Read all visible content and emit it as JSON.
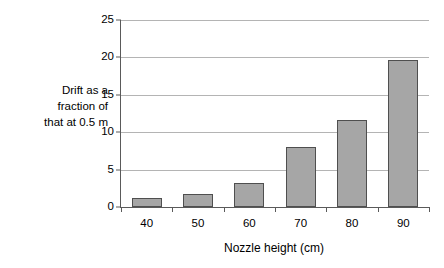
{
  "chart_data": {
    "type": "bar",
    "title": "",
    "subtitle": "",
    "xlabel": "Nozzle height (cm)",
    "ylabel": "Drift as a fraction of that at 0.5 m",
    "categories": [
      "40",
      "50",
      "60",
      "70",
      "80",
      "90"
    ],
    "values": [
      1.2,
      1.7,
      3.2,
      8.0,
      11.6,
      19.7
    ],
    "series": [
      {
        "name": "Drift ratio",
        "values": [
          1.2,
          1.7,
          3.2,
          8.0,
          11.6,
          19.7
        ]
      }
    ],
    "ylim": [
      0,
      25
    ],
    "ytick_values": [
      0,
      5,
      10,
      15,
      20,
      25
    ],
    "ytick_labels": [
      "0",
      "5",
      "10",
      "15",
      "20",
      "25"
    ],
    "xtick_labels": [
      "40",
      "50",
      "60",
      "70",
      "80",
      "90"
    ],
    "grid": "horizontal",
    "legend": "none",
    "bar_color": "#a6a6a6",
    "bar_border_color": "#4f4f4f",
    "axis_color": "#5a5a5a",
    "gridline_color": "#b4b4b4",
    "background_color": "#ffffff"
  },
  "axes": {
    "y_title_lines": "Drift as a\nfraction of\nthat at 0.5 m",
    "x_title": "Nozzle height (cm)"
  }
}
